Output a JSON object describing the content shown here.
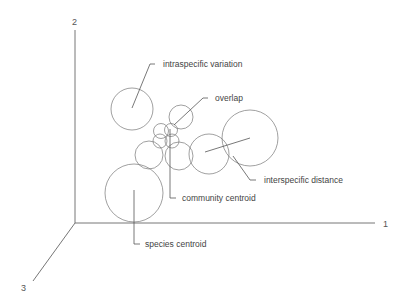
{
  "diagram": {
    "axes": {
      "axis1": "1",
      "axis2": "2",
      "axis3": "3"
    },
    "labels": {
      "intraspecific_variation": "intraspecific variation",
      "overlap": "overlap",
      "interspecific_distance": "interspecific distance",
      "community_centroid": "community centroid",
      "species_centroid": "species centroid"
    },
    "colors": {
      "line": "#555555",
      "circle": "#777777",
      "text": "#444444"
    }
  }
}
